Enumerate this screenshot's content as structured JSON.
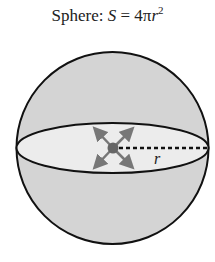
{
  "title": {
    "label": "Sphere:",
    "variable": "S",
    "equals": "=",
    "coefficient": "4π",
    "radius_symbol": "r",
    "exponent": "2"
  },
  "diagram": {
    "radius_label": "r",
    "sphere_fill": "#d4d4d4",
    "equator_fill": "#ececec",
    "stroke": "#111111",
    "arrow_color": "#777777",
    "center_color": "#666666"
  }
}
